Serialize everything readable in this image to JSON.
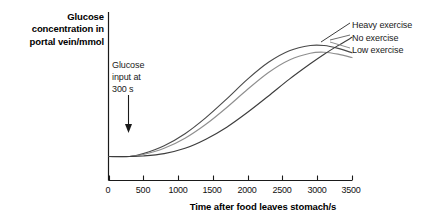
{
  "chart_data": {
    "type": "line",
    "title": "",
    "ylabel": "Glucose concentration in portal vein/mmol",
    "xlabel": "Time after food leaves stomach/s",
    "xlim": [
      0,
      3500
    ],
    "xticks": [
      0,
      500,
      1000,
      1500,
      2000,
      2500,
      3000,
      3500
    ],
    "xtick_labels": [
      "0",
      "500",
      "1000",
      "1500",
      "2000",
      "2500",
      "3000",
      "3500"
    ],
    "yticks": [],
    "ytick_labels": [],
    "grid": false,
    "legend_position": "right",
    "annotations": [
      {
        "text": "Glucose input at 300 s",
        "x": 300,
        "kind": "arrow-down-to-baseline"
      }
    ],
    "series": [
      {
        "name": "Heavy exercise",
        "color": "#4a4a4a",
        "x": [
          0,
          300,
          500,
          800,
          1100,
          1400,
          1700,
          2000,
          2300,
          2600,
          2900,
          3100,
          3300,
          3500
        ],
        "values": [
          1.0,
          1.0,
          1.12,
          1.45,
          1.95,
          2.62,
          3.4,
          4.22,
          4.92,
          5.4,
          5.62,
          5.62,
          5.5,
          5.32
        ]
      },
      {
        "name": "No exercise",
        "color": "#8f8f8f",
        "x": [
          0,
          300,
          500,
          800,
          1100,
          1400,
          1700,
          2000,
          2300,
          2600,
          2900,
          3100,
          3300,
          3500
        ],
        "values": [
          1.0,
          1.0,
          1.08,
          1.34,
          1.76,
          2.34,
          3.04,
          3.8,
          4.5,
          5.02,
          5.3,
          5.34,
          5.26,
          5.12
        ]
      },
      {
        "name": "Low exercise",
        "color": "#3d3d3d",
        "x": [
          0,
          300,
          500,
          800,
          1100,
          1400,
          1700,
          2000,
          2300,
          2600,
          2900,
          3100,
          3300,
          3500
        ],
        "values": [
          1.0,
          1.0,
          1.02,
          1.12,
          1.34,
          1.72,
          2.22,
          2.84,
          3.52,
          4.22,
          4.86,
          5.26,
          5.62,
          5.96
        ]
      }
    ]
  },
  "y_axis_title": {
    "line1": "Glucose",
    "line2": "concentration in",
    "line3": "portal vein/mmol"
  },
  "annotation": {
    "line1": "Glucose",
    "line2": "input at",
    "line3": "300 s"
  },
  "legend": {
    "item1": "Heavy exercise",
    "item2": "No exercise",
    "item3": "Low exercise"
  },
  "x_axis_title": "Time after food leaves stomach/s",
  "ticks": {
    "t0": "0",
    "t1": "500",
    "t2": "1000",
    "t3": "1500",
    "t4": "2000",
    "t5": "2500",
    "t6": "3000",
    "t7": "3500"
  },
  "colors": {
    "axis": "#1a1a1a",
    "heavy": "#4a4a4a",
    "none": "#8f8f8f",
    "low": "#3d3d3d"
  }
}
